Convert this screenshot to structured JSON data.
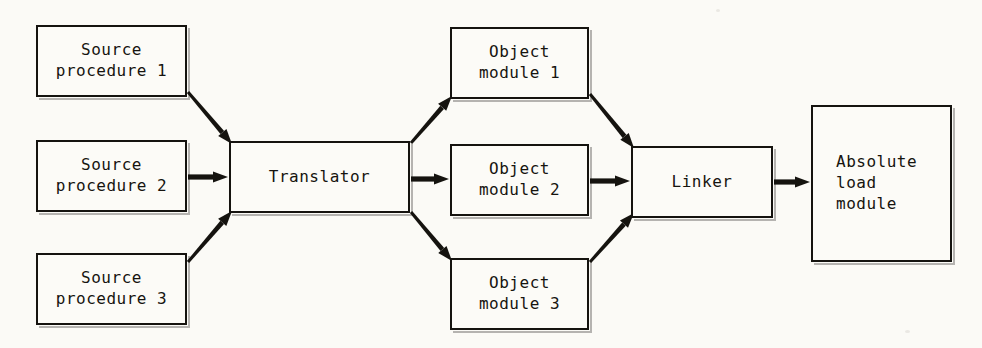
{
  "diagram": {
    "type": "flow-diagram",
    "background_color": "#fbfaf6",
    "stroke_color": "#15130f",
    "fill_color": "#fcfbf7",
    "nodes": [
      {
        "id": "source-procedure-1",
        "lines": [
          "Source",
          "procedure 1"
        ],
        "x": 36,
        "y": 25,
        "w": 151,
        "h": 72,
        "align": "center"
      },
      {
        "id": "source-procedure-2",
        "lines": [
          "Source",
          "procedure 2"
        ],
        "x": 36,
        "y": 140,
        "w": 151,
        "h": 72,
        "align": "center"
      },
      {
        "id": "source-procedure-3",
        "lines": [
          "Source",
          "procedure 3"
        ],
        "x": 36,
        "y": 253,
        "w": 151,
        "h": 72,
        "align": "center"
      },
      {
        "id": "translator",
        "lines": [
          "Translator"
        ],
        "x": 229,
        "y": 141,
        "w": 181,
        "h": 72,
        "align": "center"
      },
      {
        "id": "object-module-1",
        "lines": [
          "Object",
          "module 1"
        ],
        "x": 450,
        "y": 27,
        "w": 139,
        "h": 72,
        "align": "center"
      },
      {
        "id": "object-module-2",
        "lines": [
          "Object",
          "module 2"
        ],
        "x": 450,
        "y": 144,
        "w": 139,
        "h": 72,
        "align": "center"
      },
      {
        "id": "object-module-3",
        "lines": [
          "Object",
          "module 3"
        ],
        "x": 450,
        "y": 258,
        "w": 139,
        "h": 72,
        "align": "center"
      },
      {
        "id": "linker",
        "lines": [
          "Linker"
        ],
        "x": 631,
        "y": 146,
        "w": 142,
        "h": 72,
        "align": "center"
      },
      {
        "id": "absolute-load-module",
        "lines": [
          "Absolute",
          "load",
          "module"
        ],
        "x": 811,
        "y": 105,
        "w": 141,
        "h": 157,
        "align": "left"
      }
    ],
    "edges": [
      {
        "id": "edge-sp1-translator",
        "from": "source-procedure-1",
        "to": "translator",
        "x1": 188,
        "y1": 92,
        "x2": 232,
        "y2": 144,
        "style": "diagonal-down"
      },
      {
        "id": "edge-sp2-translator",
        "from": "source-procedure-2",
        "to": "translator",
        "x1": 188,
        "y1": 177,
        "x2": 228,
        "y2": 177,
        "style": "horizontal"
      },
      {
        "id": "edge-sp3-translator",
        "from": "source-procedure-3",
        "to": "translator",
        "x1": 188,
        "y1": 262,
        "x2": 232,
        "y2": 211,
        "style": "diagonal-up"
      },
      {
        "id": "edge-translator-om1",
        "from": "translator",
        "to": "object-module-1",
        "x1": 411,
        "y1": 143,
        "x2": 452,
        "y2": 96,
        "style": "diagonal-up"
      },
      {
        "id": "edge-translator-om2",
        "from": "translator",
        "to": "object-module-2",
        "x1": 411,
        "y1": 179,
        "x2": 449,
        "y2": 179,
        "style": "horizontal"
      },
      {
        "id": "edge-translator-om3",
        "from": "translator",
        "to": "object-module-3",
        "x1": 411,
        "y1": 212,
        "x2": 452,
        "y2": 261,
        "style": "diagonal-down"
      },
      {
        "id": "edge-om1-linker",
        "from": "object-module-1",
        "to": "linker",
        "x1": 590,
        "y1": 94,
        "x2": 634,
        "y2": 148,
        "style": "diagonal-down"
      },
      {
        "id": "edge-om2-linker",
        "from": "object-module-2",
        "to": "linker",
        "x1": 590,
        "y1": 181,
        "x2": 630,
        "y2": 181,
        "style": "horizontal"
      },
      {
        "id": "edge-om3-linker",
        "from": "object-module-3",
        "to": "linker",
        "x1": 590,
        "y1": 262,
        "x2": 634,
        "y2": 213,
        "style": "diagonal-up"
      },
      {
        "id": "edge-linker-absolute",
        "from": "linker",
        "to": "absolute-load-module",
        "x1": 774,
        "y1": 182,
        "x2": 810,
        "y2": 182,
        "style": "horizontal"
      }
    ]
  }
}
